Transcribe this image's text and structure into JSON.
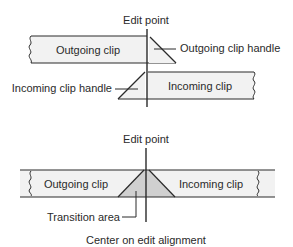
{
  "diagram_title": "Edit point transition alignment",
  "colors": {
    "line": "#2a2a2a",
    "clip_fill": "#f2f2f2",
    "transition_fill": "#d0d0d0",
    "background": "#ffffff"
  },
  "top_diagram": {
    "edit_point_label": "Edit point",
    "outgoing_clip_label": "Outgoing clip",
    "outgoing_clip_handle_label": "Outgoing clip handle",
    "incoming_clip_label": "Incoming clip",
    "incoming_clip_handle_label": "Incoming clip handle"
  },
  "bottom_diagram": {
    "edit_point_label": "Edit point",
    "outgoing_clip_label": "Outgoing clip",
    "incoming_clip_label": "Incoming clip",
    "transition_area_label": "Transition area",
    "caption": "Center on edit alignment"
  }
}
